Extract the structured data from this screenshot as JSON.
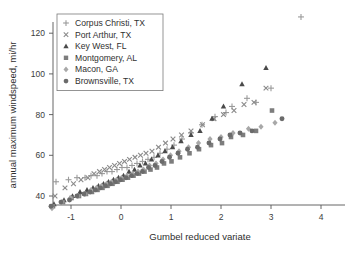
{
  "chart_data": {
    "type": "scatter",
    "title": "",
    "xlabel": "Gumbel reduced variate",
    "ylabel": "annual maximum windspeed, mi/hr",
    "xlim": [
      -1.55,
      4.2
    ],
    "ylim": [
      30,
      132
    ],
    "xticks": [
      -1,
      0,
      1,
      2,
      3,
      4
    ],
    "xticklabels": [
      "-1",
      "0",
      "1",
      "2",
      "3",
      "4"
    ],
    "yticks": [
      40,
      60,
      80,
      100,
      120
    ],
    "yticklabels": [
      "40",
      "60",
      "80",
      "100",
      "120"
    ],
    "grid": false,
    "legend_position": "upper left",
    "series": [
      {
        "name": "Corpus Christi, TX",
        "marker": "plus",
        "color": "#9a9a9a",
        "points": [
          [
            -1.3,
            47
          ],
          [
            -1.05,
            48
          ],
          [
            -0.88,
            49
          ],
          [
            -0.72,
            49
          ],
          [
            -0.6,
            50
          ],
          [
            -0.48,
            50
          ],
          [
            -0.38,
            51
          ],
          [
            -0.28,
            52
          ],
          [
            -0.18,
            52
          ],
          [
            -0.08,
            53
          ],
          [
            0.02,
            54
          ],
          [
            0.12,
            54
          ],
          [
            0.22,
            55
          ],
          [
            0.32,
            56
          ],
          [
            0.43,
            57
          ],
          [
            0.54,
            58
          ],
          [
            0.66,
            59
          ],
          [
            0.78,
            61
          ],
          [
            0.92,
            63
          ],
          [
            1.06,
            65
          ],
          [
            1.22,
            68
          ],
          [
            1.4,
            71
          ],
          [
            1.62,
            75
          ],
          [
            1.88,
            79
          ],
          [
            2.1,
            81
          ],
          [
            2.22,
            84
          ],
          [
            2.52,
            88
          ],
          [
            2.7,
            86
          ],
          [
            3.0,
            93
          ],
          [
            3.6,
            128
          ]
        ]
      },
      {
        "name": "Port Arthur, TX",
        "marker": "cross",
        "color": "#8a8a8a",
        "points": [
          [
            -1.32,
            40
          ],
          [
            -1.12,
            44
          ],
          [
            -0.95,
            46
          ],
          [
            -0.8,
            48
          ],
          [
            -0.66,
            49
          ],
          [
            -0.54,
            51
          ],
          [
            -0.43,
            52
          ],
          [
            -0.33,
            53
          ],
          [
            -0.23,
            54
          ],
          [
            -0.13,
            55
          ],
          [
            -0.03,
            56
          ],
          [
            0.07,
            57
          ],
          [
            0.17,
            58
          ],
          [
            0.28,
            59
          ],
          [
            0.39,
            60
          ],
          [
            0.5,
            61
          ],
          [
            0.62,
            62
          ],
          [
            0.75,
            64
          ],
          [
            0.89,
            66
          ],
          [
            1.04,
            68
          ],
          [
            1.21,
            70
          ],
          [
            1.4,
            72
          ],
          [
            1.63,
            75
          ],
          [
            1.86,
            78
          ],
          [
            2.05,
            80
          ],
          [
            2.26,
            82
          ],
          [
            2.46,
            85
          ],
          [
            2.66,
            86
          ],
          [
            2.9,
            93
          ]
        ]
      },
      {
        "name": "Key West, FL",
        "marker": "triangle",
        "color": "#4a4a4a",
        "points": [
          [
            -1.34,
            36
          ],
          [
            -1.14,
            38
          ],
          [
            -0.97,
            40
          ],
          [
            -0.82,
            42
          ],
          [
            -0.68,
            43
          ],
          [
            -0.56,
            44
          ],
          [
            -0.45,
            45
          ],
          [
            -0.35,
            46
          ],
          [
            -0.25,
            47
          ],
          [
            -0.15,
            48
          ],
          [
            -0.05,
            49
          ],
          [
            0.05,
            50
          ],
          [
            0.16,
            52
          ],
          [
            0.27,
            53
          ],
          [
            0.38,
            55
          ],
          [
            0.49,
            56
          ],
          [
            0.61,
            58
          ],
          [
            0.74,
            60
          ],
          [
            0.88,
            62
          ],
          [
            1.03,
            64
          ],
          [
            1.2,
            67
          ],
          [
            1.4,
            70
          ],
          [
            1.58,
            72
          ],
          [
            1.82,
            78
          ],
          [
            2.05,
            84
          ],
          [
            2.42,
            95
          ],
          [
            2.9,
            103
          ]
        ]
      },
      {
        "name": "Montgomery, AL",
        "marker": "square",
        "color": "#7d7d7d",
        "points": [
          [
            -1.36,
            35
          ],
          [
            -1.16,
            37
          ],
          [
            -0.99,
            39
          ],
          [
            -0.84,
            40
          ],
          [
            -0.7,
            41
          ],
          [
            -0.58,
            42
          ],
          [
            -0.47,
            43
          ],
          [
            -0.37,
            44
          ],
          [
            -0.27,
            45
          ],
          [
            -0.17,
            46
          ],
          [
            -0.07,
            47
          ],
          [
            0.03,
            48
          ],
          [
            0.14,
            49
          ],
          [
            0.25,
            50
          ],
          [
            0.36,
            51
          ],
          [
            0.47,
            52
          ],
          [
            0.59,
            53
          ],
          [
            0.72,
            54
          ],
          [
            0.86,
            56
          ],
          [
            1.01,
            57
          ],
          [
            1.18,
            59
          ],
          [
            1.37,
            61
          ],
          [
            1.56,
            63
          ],
          [
            1.8,
            65
          ],
          [
            2.02,
            66
          ],
          [
            2.2,
            69
          ],
          [
            2.44,
            70
          ],
          [
            2.7,
            72
          ],
          [
            3.02,
            82
          ]
        ]
      },
      {
        "name": "Macon, GA",
        "marker": "diamond",
        "color": "#a8a8a8",
        "points": [
          [
            -1.38,
            34
          ],
          [
            -1.18,
            37
          ],
          [
            -1.01,
            39
          ],
          [
            -0.86,
            40
          ],
          [
            -0.72,
            41
          ],
          [
            -0.6,
            43
          ],
          [
            -0.49,
            44
          ],
          [
            -0.39,
            45
          ],
          [
            -0.29,
            46
          ],
          [
            -0.19,
            47
          ],
          [
            -0.09,
            48
          ],
          [
            0.01,
            49
          ],
          [
            0.12,
            50
          ],
          [
            0.23,
            51
          ],
          [
            0.34,
            52
          ],
          [
            0.45,
            53
          ],
          [
            0.57,
            55
          ],
          [
            0.7,
            56
          ],
          [
            0.84,
            58
          ],
          [
            0.99,
            60
          ],
          [
            1.16,
            62
          ],
          [
            1.35,
            64
          ],
          [
            1.55,
            66
          ],
          [
            1.78,
            68
          ],
          [
            2.0,
            69
          ],
          [
            2.24,
            71
          ],
          [
            2.55,
            73
          ],
          [
            2.8,
            74
          ],
          [
            3.08,
            76
          ]
        ]
      },
      {
        "name": "Brownsville, TX",
        "marker": "circle",
        "color": "#6b6b6b",
        "points": [
          [
            -1.4,
            35
          ],
          [
            -1.2,
            37
          ],
          [
            -1.03,
            38
          ],
          [
            -0.88,
            40
          ],
          [
            -0.74,
            41
          ],
          [
            -0.62,
            42
          ],
          [
            -0.51,
            43
          ],
          [
            -0.41,
            44
          ],
          [
            -0.31,
            45
          ],
          [
            -0.21,
            46
          ],
          [
            -0.11,
            47
          ],
          [
            -0.01,
            48
          ],
          [
            0.1,
            49
          ],
          [
            0.21,
            50
          ],
          [
            0.32,
            51
          ],
          [
            0.43,
            52
          ],
          [
            0.55,
            54
          ],
          [
            0.68,
            55
          ],
          [
            0.82,
            57
          ],
          [
            0.97,
            59
          ],
          [
            1.14,
            61
          ],
          [
            1.33,
            63
          ],
          [
            1.53,
            64
          ],
          [
            1.76,
            66
          ],
          [
            1.98,
            68
          ],
          [
            2.18,
            70
          ],
          [
            2.38,
            71
          ],
          [
            2.62,
            72
          ],
          [
            3.22,
            78
          ]
        ]
      }
    ]
  },
  "legend": {
    "entries": [
      {
        "label": "Corpus Christi, TX"
      },
      {
        "label": "Port Arthur, TX"
      },
      {
        "label": "Key West, FL"
      },
      {
        "label": "Montgomery, AL"
      },
      {
        "label": "Macon, GA"
      },
      {
        "label": "Brownsville, TX"
      }
    ]
  }
}
